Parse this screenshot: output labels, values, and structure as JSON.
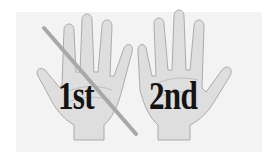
{
  "image": {
    "description": "Two open palm hands; the left labeled 1st is crossed out with a diagonal slash, the right labeled 2nd",
    "labels": {
      "first": "1st",
      "second": "2nd"
    },
    "colors": {
      "background": "#ffffff",
      "panel": "#f3f3f3",
      "hand_fill": "#dedede",
      "hand_outline": "#9a9a9a",
      "text": "#141414",
      "slash": "#a8a8a8"
    }
  }
}
